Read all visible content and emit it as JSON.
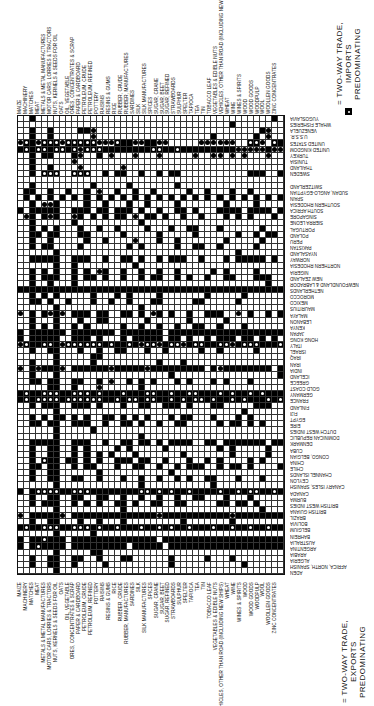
{
  "chart_data": {
    "type": "table",
    "columns": [
      "MAIZE",
      "MACHINERY",
      "MATCHES",
      "MEAT",
      "METALS & METAL MANUFACTURES",
      "MOTOR CARS, LORRIES & TRACTORS",
      "NUTS, KERNELS & SEEDS FOR OIL",
      "OATS",
      "OIL, VEGETABLE",
      "ORES, CONCENTRATES & SCRAP",
      "PAPER & CARDBOARD",
      "PETROLEUM, CRUDE",
      "PETROLEUM, REFINED",
      "POTTERY",
      "RAISINS",
      "RESINS & GUMS",
      "RICE",
      "RUBBER, CRUDE",
      "RUBBER, MANUFACTURES",
      "SARDINES",
      "SILK",
      "SILK MANUFACTURES",
      "SPICES",
      "SUGAR, CRANE",
      "SUGAR, BEET",
      "SUGAR, REFINED",
      "STRAWBOARDS",
      "SULPHUR",
      "SPELTER",
      "TAPIOCA",
      "TEA",
      "TIN",
      "TOBACCO LEAF",
      "VEGETABLES & EDIBLE NUTS",
      "VEHICLES, OTHER THAN ROAD (INCLUDING NEW SHIPS)",
      "WHEAT",
      "WINE",
      "WINES & SPIRITS",
      "WOOD",
      "WOOD GOODS",
      "WOODPULP",
      "WOOL",
      "WOOLLEN GOODS",
      "ZINC CONCENTRATES"
    ],
    "rows": [
      "YUGOSLAVIA",
      "WHALE FISHERIES",
      "VENEZUELA",
      "U.S.S.R.",
      "UNITED STATES",
      "UNITED KINGDOM",
      "TURKEY",
      "TUNISIA",
      "THAILAND",
      "SWEDEN",
      "",
      "SWITZERLAND",
      "SUDAN, ANGLO-EGYPTIAN",
      "SPAIN",
      "SOUTHERN RHODESIA",
      "SOUTH AFRICA",
      "SINGAPORE",
      "SIERRA LEONE",
      "PORTUGAL",
      "POLAND",
      "PERU",
      "PAKISTAN",
      "NYASALAND",
      "NORWAY",
      "NORTHERN RHODESIA",
      "NIGERIA",
      "NEW ZEALAND",
      "NEWFOUNDLAND & LABRADOR",
      "NETHERLANDS",
      "MOROCCO",
      "MEXICO",
      "MAURITIUS",
      "MALAYA",
      "LEBANON",
      "KENYA",
      "JAPAN",
      "HONG KONG",
      "ITALY",
      "ISRAEL",
      "IRAQ",
      "IRAN",
      "INDIA",
      "ICELAND",
      "GREECE",
      "GOLD COAST",
      "GERMANY",
      "FRANCE",
      "FINLAND",
      "FIJI",
      "EGYPT",
      "EIRE",
      "DUTCH WEST INDIES",
      "DOMINICAN REPUBLIC",
      "DENMARK",
      "CUBA",
      "CONGO, BELGIAN",
      "CHINA",
      "CHILE",
      "CHANNEL ISLANDS",
      "CEYLON",
      "CANARY ISLES, SPANISH",
      "CANADA",
      "BURMA",
      "BRITISH WEST INDIES",
      "BRITISH GUIANA",
      "BRAZIL",
      "BOLIVIA",
      "BELGIUM",
      "BAHREIN",
      "AUSTRALIA",
      "ARGENTINA",
      "ARABIA",
      "ALGERIA",
      "AFRICA, NORTH, SPANISH",
      "ADEN"
    ],
    "symbol_key": {
      "S": "exports (solid square)",
      "D": "imports (solid dot)",
      "T": "two-way trade",
      ".": "none"
    },
    "cells": [
      "..S.......................................S.S",
      "...................................S........",
      "..S..S....SSD...........................SD..",
      "..S..S......D...................S......S.D..",
      "DTSDTTTDTTTTTDDDTSSDDSSDD.....DDDDDD..TTD.TS",
      "STSTTSTTSTDTTTSSSSSSSSTTSSTSSSSSSSSSDDDDDSDD",
      "..S.SS...SD..S.D...D...D.....D..DD.D.D...D..",
      "..S......D....................................",
      "..S..S....D......D..........................",
      "..S.TTT..TTT..S.SS..S..S.SS...........SSS..S",
      "............................................",
      "..S.........S.....S.......S.................",
      ".SS..S..S..S.D..S..S..S.....S..S...S..S.....",
      ".S.S.S.S.S.S.S.S.S.S.S.S.S.S.S.S.S.S.S.S.S.S",
      "..S.DDS....S..S...S..S....S.......S....S....",
      "S.SSSSS..SSS.SS.SSS.S..S..SS.S...SSSS.SSSS.S",
      ".DS.SDS..DS.S.S.SS.D.SS.S..S..S...S.S.S...S.",
      "..S......S..........S.......................",
      "..S.S.S...S..S..S....S...S..SS...S......S...",
      "..SS.SS...SS.....S.....S.....S......S..S.SS.",
      "..S..S.....S..S....D...S..S.......S.....S...",
      "..S.SS....S.......S.S.....S..SS..S.....S....",
      "......S.............................S.......",
      "..SSSSS..SSS..S..SS.S..S.SSS..S...S.SSSSS.S.",
      "......S..S.........S........................",
      "..S.S.S..S.S.DS..S..S..S..S.....S.S....S....",
      "..S.SSS..S.SS.S..S..S.SS..S.S..S..SS...SSS..",
      "..S..S...S...............................S..",
      "SSSSSSSSSSSSSSSSSSSSSSSSSSSSSSSSSSSSSSSSSSSS",
      "..S.S.S.....S...S.S....S.......S.....S......",
      "..SS.S..S...S..S..S...SS.....SS.....S.......",
      "......S.............S.......................",
      "D.S.SDSD.SSS.SS..SS.S.DS.S..S..SSS..D.S..S.S",
      "..S...S...S..SS......S......S.....S.........",
      "..S.S.S..S.S.....S..S..S..S..SS..S...S......",
      "S.SSSSSS.SSSSSSS.SSSSSSS.SSSSSSSSSSSSSSSSSSS",
      "S.SSSSS..SSS.S...S.SSSSS.SS.S..S.SSS.SS.S.S.",
      "DTSSTTSDTTTTTTSTSSTSDTTDSTTDSTTSSTTDSTTTSSST",
      "..S..SS...S..S..SS...S..S.....S..S.....S....",
      "......S.....SS..............................",
      "..S...S.....S..........S...S................",
      "D.SDSSSD.SSSSSSDSSSSSDSSSSSSSSS.SDSSSSSSSS.S",
      "..S...S..................S.................S",
      "..SS.SS..SS..S.D..S.S.S...S.S...S.S...S.....",
      ".....SS..S...D......S.......................",
      "STSSTTTSSTTTSTSSSTSSSTTSSTSSTTSSSTSTSSTSTSSS",
      "STSTTTTSTTTTTTSSTSTTSTTSSTSTSTTSTSSTSTSSSTST",
      "..S.SSS..SSS.S...S..SS..SSS.S...SS.....SSS..",
      "......S..............................S......",
      "..S.S.SS.S.S..SS.S.S.S...S.SS...S...S.S.....",
      "..SS.SS..SSS..S..SS.S..S..SS.....S.SS.S.S...",
      "......S.....S...............................",
      "......S.............S......................",
      "..SSSSS..SSS..S..SS.SS.S.SSSS..SS.SSSSSSS.SS",
      "..S..SS..S.S....S.S.....S........S.S.....S..",
      "..S..SS..S.S.S.S...S.......S.......S.....S..",
      "..S.TSS.SS.S.S..SSS.SS..S...S..S.S....S.S...",
      "..SS.SS..S.SS...S..SS..S..S.SSS..S.SS.S....S",
      "..S..SS......S...........S..................",
      "..S..SS..SS..S...S..S..S..S.S..SS...S...S...",
      "......S.............S...........S...........",
      "S.STTTTSSTTTSSSSSSSSTTSTSTSSTSSSSTSSTSTTSSTS",
      "..S..SS..SS..SS..S..S..S..S..SS...S...S.....",
      "..S.SSS..S.S.S..SS.S..SS..SS.....SS.SS.S....",
      "......S..........S......................S...",
      "D.SSSSSD.SSSSSSSSSSSSSSDSSSSSSSSSSSDSSSSSSSS",
      "..S..SS...S..S...S.........S.......S.......",
      "STSSTTTSSTTTSTSSTSSSTSSTSTSSTSSSTSSTSSTSSTSS",
      "......S.....S...............................",
      "S.SSTSSS.SSSSSSSSSSSSSS.SSSSSSSSSSSSSSSSSSSS",
      "S.STSSSS.SSSSSSSSS.SSSSS.SSSSSSSSSSSSSSSSSSS",
      "......S.....SS..............................",
      "..S..SS..SS..S...SS......S.....S...S.......",
      "..S..SS..S....S..........S...........S.....",
      "......S.....................................",
      "..S...S.....D.......D......................."
    ],
    "legend": [
      {
        "symbol": "two-way-import",
        "label": "= TWO-WAY TRADE, IMPORTS PREDOMINATING"
      },
      {
        "symbol": "two-way-export",
        "label": "= TWO-WAY TRADE, EXPORTS PREDOMINATING"
      }
    ]
  },
  "legend": {
    "top": {
      "line1": "= TWO-WAY TRADE,",
      "line2": "IMPORTS",
      "line3": "PREDOMINATING"
    },
    "bottom": {
      "line1": "= TWO-WAY TRADE,",
      "line2": "EXPORTS",
      "line3": "PREDOMINATING"
    }
  }
}
